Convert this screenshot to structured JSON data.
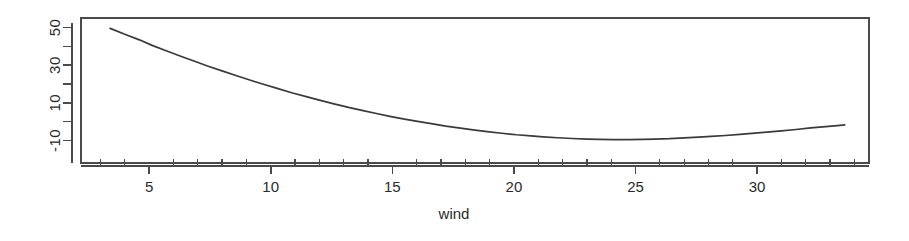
{
  "chart_data": {
    "type": "line",
    "title": "",
    "xlabel": "wind",
    "ylabel": "",
    "xlim": [
      2.2,
      34.6
    ],
    "ylim": [
      -22,
      55
    ],
    "grid": false,
    "legend": "none",
    "x_ticks_major": [
      5,
      10,
      15,
      20,
      25,
      30
    ],
    "x_tick_labels": [
      "5",
      "10",
      "15",
      "20",
      "25",
      "30"
    ],
    "x_ticks_minor": [
      3,
      4,
      6,
      7,
      8,
      9,
      11,
      12,
      13,
      14,
      16,
      17,
      18,
      19,
      21,
      22,
      23,
      24,
      26,
      27,
      28,
      29,
      31,
      32,
      33,
      34
    ],
    "y_ticks_major": [
      50,
      30,
      10,
      -10
    ],
    "y_tick_labels": [
      "50",
      "30",
      "10",
      "-10"
    ],
    "y_ticks_minor": [
      40,
      20,
      0
    ],
    "series": [
      {
        "name": "partial effect of wind",
        "x": [
          3.4,
          4.0,
          4.6,
          5.1,
          5.7,
          6.3,
          6.9,
          7.4,
          8.0,
          8.6,
          9.2,
          9.7,
          10.3,
          10.9,
          11.5,
          12.0,
          12.6,
          13.2,
          13.8,
          14.3,
          14.9,
          15.5,
          16.1,
          16.6,
          17.2,
          17.8,
          18.4,
          18.9,
          19.5,
          20.1,
          20.7,
          21.2,
          21.8,
          22.4,
          23.0,
          23.5,
          24.1,
          24.7,
          25.3,
          25.8,
          26.4,
          27.0,
          27.6,
          28.1,
          28.7,
          29.3,
          29.9,
          30.4,
          31.0,
          31.6,
          32.2,
          32.7,
          33.3,
          33.6
        ],
        "y": [
          49.5,
          46.4,
          43.4,
          40.6,
          37.6,
          34.7,
          31.9,
          29.5,
          26.9,
          24.3,
          21.8,
          19.8,
          17.5,
          15.2,
          13.1,
          11.4,
          9.4,
          7.5,
          5.8,
          4.4,
          2.8,
          1.3,
          0.0,
          -1.1,
          -2.4,
          -3.5,
          -4.5,
          -5.3,
          -6.2,
          -7.0,
          -7.6,
          -8.1,
          -8.6,
          -9.0,
          -9.3,
          -9.5,
          -9.6,
          -9.6,
          -9.5,
          -9.3,
          -9.1,
          -8.7,
          -8.3,
          -7.9,
          -7.4,
          -6.8,
          -6.1,
          -5.6,
          -4.9,
          -4.2,
          -3.4,
          -2.8,
          -2.1,
          -1.8
        ]
      }
    ],
    "notes": {
      "curve_start_x": 3.4,
      "curve_start_y": 49.5,
      "curve_min_x": 24.4,
      "curve_min_y": -9.6,
      "curve_end_x": 33.6,
      "curve_end_y": -1.8
    }
  },
  "axes": {
    "x_title": "wind"
  },
  "style": {
    "line_color": "#3a3a3a",
    "axis_color": "#4a4a4a",
    "background": "#ffffff",
    "text_color": "#2b2b2b"
  }
}
